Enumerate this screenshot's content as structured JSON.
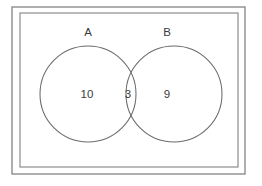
{
  "figure": {
    "background_color": "#ffffff",
    "frame_color": "#8d8d8d",
    "circle_stroke_color": "#6b6b6b",
    "text_color": "#3a3a3a"
  },
  "chart_data": {
    "type": "diagram",
    "diagram_type": "venn",
    "title": "",
    "xlabel": "",
    "ylabel": "",
    "grid": false,
    "legend": "none",
    "sets": [
      {
        "id": "A",
        "label": "A",
        "only_count": "10",
        "label_x": 88,
        "label_y": 33,
        "count_x": 87,
        "count_y": 95,
        "cx": 88,
        "cy": 94,
        "r": 48
      },
      {
        "id": "B",
        "label": "B",
        "only_count": "9",
        "label_x": 167,
        "label_y": 33,
        "count_x": 167,
        "count_y": 95,
        "cx": 174,
        "cy": 94,
        "r": 48
      }
    ],
    "intersection": {
      "id": "A_and_B",
      "label": "A ∩ B",
      "count": "3",
      "count_x": 128,
      "count_y": 95
    },
    "regions": [
      {
        "name": "A only",
        "value": 10
      },
      {
        "name": "A and B",
        "value": 3
      },
      {
        "name": "B only",
        "value": 9
      }
    ],
    "total": 22
  },
  "frame": {
    "outer": {
      "x": 12,
      "y": 7,
      "width": 233,
      "height": 167
    },
    "inner": {
      "x": 20,
      "y": 13,
      "width": 218,
      "height": 154
    }
  }
}
